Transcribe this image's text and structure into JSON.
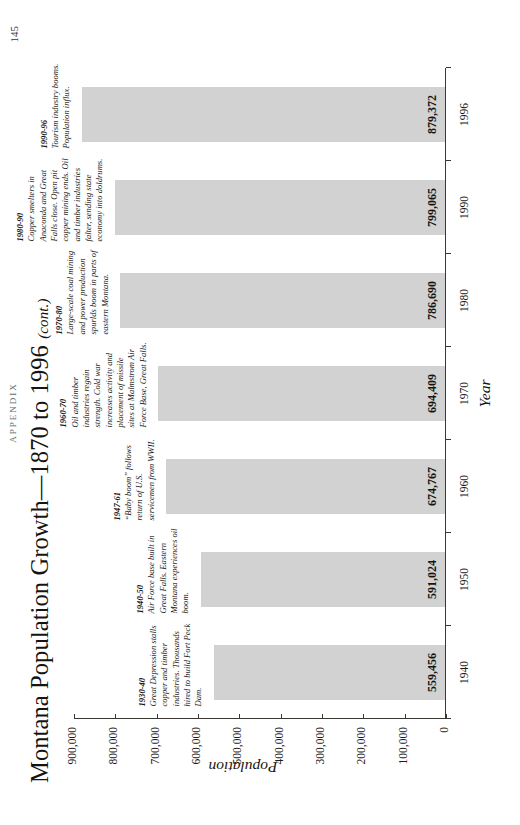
{
  "page": {
    "folio": "APPENDIX",
    "number": "145"
  },
  "figure": {
    "title_main": "Montana Population Growth—1870 to 1996",
    "title_suffix": "(cont.)"
  },
  "chart_data": {
    "type": "bar",
    "title": "Montana Population Growth—1870 to 1996 (cont.)",
    "xlabel": "Year",
    "ylabel": "Population",
    "ylim": [
      0,
      900000
    ],
    "grid": false,
    "legend": "none",
    "orientation": "vertical",
    "bar_color": "#d2d2d2",
    "categories": [
      "1940",
      "1950",
      "1960",
      "1970",
      "1980",
      "1990",
      "1996"
    ],
    "values": [
      559456,
      591024,
      674767,
      694409,
      786690,
      799065,
      879372
    ],
    "value_labels": [
      "559,456",
      "591,024",
      "674,767",
      "694,409",
      "786,690",
      "799,065",
      "879,372"
    ],
    "ytick_values": [
      0,
      100000,
      200000,
      300000,
      400000,
      500000,
      600000,
      700000,
      800000,
      900000
    ],
    "ytick_labels": [
      "0",
      "100,000",
      "200,000",
      "300,000",
      "400,000",
      "500,000",
      "600,000",
      "700,000",
      "800,000",
      "900,000"
    ],
    "annotations": [
      {
        "period": "1930-40",
        "text": "Great Depression stalls copper and timber industries. Thousands hired to build Fort Peck Dam.",
        "anchor_category": "1940"
      },
      {
        "period": "1940-50",
        "text": "Air Force base built in Great Falls. Eastern Montana experiences oil boom.",
        "anchor_category": "1950"
      },
      {
        "period": "1947-61",
        "text": "“Baby boom” follows return of U.S. servicemen from WWII.",
        "anchor_category": "1960"
      },
      {
        "period": "1960-70",
        "text": "Oil and timber industries regain strength. Cold war increases activity and placement of missile sites at Malmstrom Air Force Base, Great Falls.",
        "anchor_category": "1970"
      },
      {
        "period": "1970-80",
        "text": "Large-scale coal mining and power production spurlds boom in parts of eastern Montana.",
        "anchor_category": "1980"
      },
      {
        "period": "1980-90",
        "text": "Copper smelters in Anaconda and Great Falls close. Open pit copper mining ends. Oil and timber industries falter, sending state economy into doldrums.",
        "anchor_category": "1990"
      },
      {
        "period": "1990-96",
        "text": "Tourism industry booms. Population influx.",
        "anchor_category": "1996"
      }
    ]
  }
}
